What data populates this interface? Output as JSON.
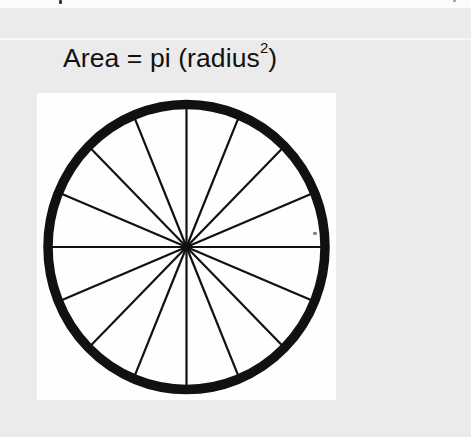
{
  "page": {
    "background_color": "#ebebeb",
    "figure_background_color": "#fefefe",
    "stroke_color": "#111111"
  },
  "formula": {
    "prefix": "Area = pi (radius",
    "superscript": "2",
    "suffix": ")"
  },
  "diagram": {
    "shape": "circle",
    "spoke_count": 16,
    "spoke_angle_step_deg": 22.5
  }
}
